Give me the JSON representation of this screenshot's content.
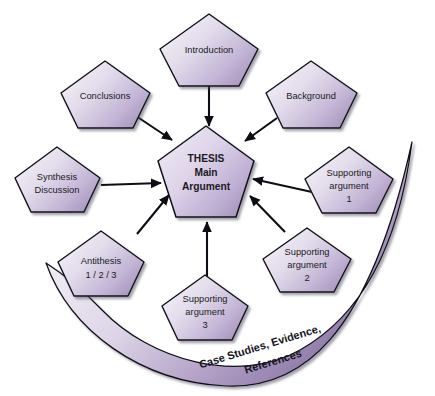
{
  "diagram": {
    "background_color": "#ffffff",
    "shape_type": "pentagon",
    "colors": {
      "fill_light": "#f2eef6",
      "fill_mid": "#d9cfe4",
      "fill_dark": "#9d8cb5",
      "outline": "#111118",
      "text": "#1a1a22",
      "banner_light": "#f4f1f7",
      "banner_dark": "#8f7da9"
    },
    "center": {
      "id": "thesis",
      "lines": [
        "THESIS",
        "Main",
        "Argument"
      ],
      "bold": true
    },
    "nodes": [
      {
        "id": "introduction",
        "lines": [
          "Introduction"
        ],
        "position": "top"
      },
      {
        "id": "conclusions",
        "lines": [
          "Conclusions"
        ],
        "position": "top-left"
      },
      {
        "id": "background",
        "lines": [
          "Background"
        ],
        "position": "top-right"
      },
      {
        "id": "synthesis-discussion",
        "lines": [
          "Synthesis",
          "Discussion"
        ],
        "position": "left"
      },
      {
        "id": "supporting-argument-1",
        "lines": [
          "Supporting",
          "argument",
          "1"
        ],
        "position": "right"
      },
      {
        "id": "antithesis",
        "lines": [
          "Antithesis",
          "1 / 2 / 3"
        ],
        "position": "bottom-left"
      },
      {
        "id": "supporting-argument-2",
        "lines": [
          "Supporting",
          "argument",
          "2"
        ],
        "position": "bottom-right"
      },
      {
        "id": "supporting-argument-3",
        "lines": [
          "Supporting",
          "argument",
          "3"
        ],
        "position": "bottom"
      }
    ],
    "banner": {
      "id": "case-studies-banner",
      "lines": [
        "Case Studies, Evidence,",
        "References"
      ],
      "shape": "crescent-arc"
    },
    "arrows": [
      {
        "from": "introduction",
        "to": "thesis"
      },
      {
        "from": "conclusions",
        "to": "thesis"
      },
      {
        "from": "background",
        "to": "thesis"
      },
      {
        "from": "synthesis-discussion",
        "to": "thesis"
      },
      {
        "from": "supporting-argument-1",
        "to": "thesis"
      },
      {
        "from": "antithesis",
        "to": "thesis"
      },
      {
        "from": "supporting-argument-2",
        "to": "thesis"
      },
      {
        "from": "supporting-argument-3",
        "to": "thesis"
      }
    ]
  }
}
